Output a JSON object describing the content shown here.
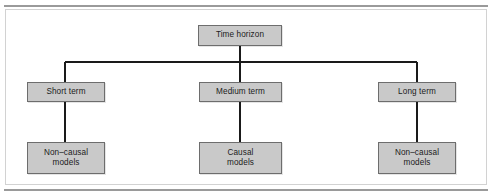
{
  "figure": {
    "type": "tree-diagram",
    "orientation": "top-down",
    "background_color": "#ffffff",
    "node_fill_color": "#c9c9c9",
    "node_border_color": "#6d6d6d",
    "connector_color": "#1a1a1a",
    "rule_color": "#9a9a9a",
    "frame_color": "#d2d2d2"
  },
  "nodes": {
    "root": {
      "label": "Time horizon"
    },
    "level1": [
      {
        "id": "short",
        "label": "Short term"
      },
      {
        "id": "medium",
        "label": "Medium term"
      },
      {
        "id": "long",
        "label": "Long term"
      }
    ],
    "level2": [
      {
        "id": "left",
        "label": "Non–causal\nmodels"
      },
      {
        "id": "mid",
        "label": "Causal\nmodels"
      },
      {
        "id": "right",
        "label": "Non–causal\nmodels"
      }
    ]
  },
  "edges": [
    {
      "from": "root",
      "to": "bus"
    },
    {
      "from": "bus",
      "to": "short"
    },
    {
      "from": "bus",
      "to": "medium"
    },
    {
      "from": "bus",
      "to": "long"
    },
    {
      "from": "short",
      "to": "left"
    },
    {
      "from": "medium",
      "to": "mid"
    },
    {
      "from": "long",
      "to": "right"
    }
  ]
}
